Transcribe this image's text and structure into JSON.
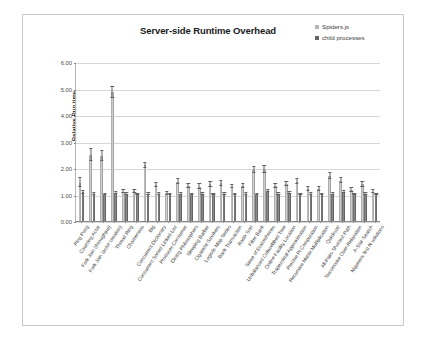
{
  "chart_data": {
    "type": "bar",
    "title": "Server-side Runtime Overhead",
    "xlabel": "",
    "ylabel": "Relative Run time",
    "ylim": [
      0,
      6
    ],
    "ytick_labels": [
      "0.00",
      "1.00",
      "2.00",
      "3.00",
      "4.00",
      "5.00",
      "6.00"
    ],
    "ytick_values": [
      0,
      1,
      2,
      3,
      4,
      5,
      6
    ],
    "grid": true,
    "legend_position": "top-right",
    "legend": [
      "Spiders.js",
      "child processes"
    ],
    "colors": {
      "series1": "#b3b3b3",
      "series2": "#666666",
      "gridline": "#d7d7d7",
      "axis": "#8a8a8a",
      "frame": "#c9c9c9",
      "title_text": "#1a1a1a"
    },
    "categories": [
      "Ping Pong",
      "Counting Actor",
      "Fork Join (throughput)",
      "Fork Join (actor creation)",
      "Thread Ring",
      "Chameneos",
      "Big",
      "Concurrent Dictionary",
      "Concurrent Sorted Linked-List",
      "Producer-Consumer",
      "Dining Philosophers",
      "Sleeping Barber",
      "Cigarette Smokers",
      "Logistic Map Series",
      "Bank Transaction",
      "Radix Sort",
      "Filter Bank",
      "Sieve of Eratosthenes",
      "Unbalanced Cobwebbed Tree",
      "Online Facility Location",
      "Trapezoidal Approximation",
      "Precise Pi Computation",
      "Recursive Matrix Multiplication",
      "Quicksort",
      "All-Pairs Shortest Path",
      "Successive Over-Relaxation",
      "A-Star Search",
      "Nqueens first N solutions"
    ],
    "series": [
      {
        "name": "Spiders.js",
        "values": [
          1.45,
          2.5,
          2.45,
          4.85,
          1.1,
          1.12,
          2.1,
          1.35,
          1.05,
          1.48,
          1.32,
          1.3,
          1.38,
          1.42,
          1.3,
          1.32,
          1.92,
          1.95,
          1.32,
          1.4,
          1.48,
          1.2,
          1.22,
          1.7,
          1.52,
          1.18,
          1.38,
          1.1
        ],
        "errors": [
          0.18,
          0.22,
          0.2,
          0.22,
          0.06,
          0.06,
          0.1,
          0.08,
          0.05,
          0.1,
          0.08,
          0.08,
          0.08,
          0.08,
          0.07,
          0.07,
          0.12,
          0.14,
          0.08,
          0.08,
          0.09,
          0.07,
          0.07,
          0.1,
          0.09,
          0.07,
          0.08,
          0.06
        ]
      },
      {
        "name": "child processes",
        "values": [
          1.08,
          1.02,
          1.0,
          1.05,
          1.02,
          1.0,
          1.02,
          1.02,
          1.0,
          1.02,
          1.0,
          1.02,
          1.0,
          1.02,
          1.0,
          1.02,
          1.0,
          1.12,
          1.02,
          1.05,
          1.0,
          1.02,
          1.0,
          1.02,
          1.08,
          1.0,
          1.02,
          1.0
        ],
        "errors": [
          0.05,
          0.04,
          0.03,
          0.04,
          0.03,
          0.03,
          0.03,
          0.03,
          0.03,
          0.03,
          0.03,
          0.03,
          0.03,
          0.03,
          0.03,
          0.03,
          0.03,
          0.04,
          0.03,
          0.03,
          0.03,
          0.03,
          0.03,
          0.03,
          0.04,
          0.03,
          0.03,
          0.03
        ]
      }
    ]
  }
}
